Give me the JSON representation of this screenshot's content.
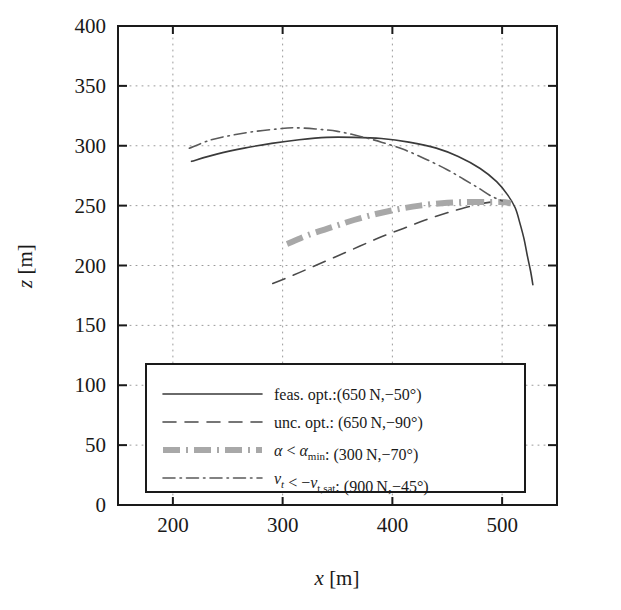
{
  "chart_data": {
    "type": "line",
    "title": "",
    "xlabel": "x [m]",
    "ylabel": "z [m]",
    "xlim": [
      150,
      550
    ],
    "ylim": [
      0,
      400
    ],
    "xticks": [
      200,
      300,
      400,
      500
    ],
    "yticks": [
      0,
      50,
      100,
      150,
      200,
      250,
      300,
      350,
      400
    ],
    "grid": true,
    "grid_style": "dotted",
    "legend_position": "lower-center",
    "series": [
      {
        "name": "feas. opt.:(650 N,−50°)",
        "label_plain": "feas. opt.:(650N,-50°)",
        "style": "solid",
        "color": "#3a3a3a",
        "width": 1.6,
        "points": [
          [
            217,
            287
          ],
          [
            240,
            293
          ],
          [
            265,
            298
          ],
          [
            290,
            302
          ],
          [
            315,
            305
          ],
          [
            340,
            307
          ],
          [
            365,
            307
          ],
          [
            390,
            306
          ],
          [
            415,
            303
          ],
          [
            440,
            298
          ],
          [
            460,
            291
          ],
          [
            480,
            281
          ],
          [
            495,
            270
          ],
          [
            505,
            259
          ],
          [
            512,
            248
          ],
          [
            516,
            236
          ],
          [
            520,
            222
          ],
          [
            523,
            208
          ],
          [
            526,
            195
          ],
          [
            528,
            184
          ]
        ]
      },
      {
        "name": "unc. opt.: (650 N,−90°)",
        "label_plain": "unc. opt.: (650N,-90°)",
        "style": "dashed",
        "color": "#4a4a4a",
        "width": 1.6,
        "points": [
          [
            291,
            185
          ],
          [
            310,
            192
          ],
          [
            330,
            200
          ],
          [
            350,
            208
          ],
          [
            370,
            216
          ],
          [
            390,
            224
          ],
          [
            410,
            231
          ],
          [
            430,
            238
          ],
          [
            450,
            244
          ],
          [
            465,
            248
          ],
          [
            478,
            251
          ],
          [
            490,
            253
          ],
          [
            500,
            254
          ]
        ]
      },
      {
        "name": "α < αmin: (300 N,−70°)",
        "label_plain": "α < α_min: (300N,-70°)",
        "style": "thick-dashdot",
        "color": "#a8a8a8",
        "width": 6.0,
        "points": [
          [
            304,
            218
          ],
          [
            325,
            226
          ],
          [
            345,
            232
          ],
          [
            365,
            238
          ],
          [
            385,
            243
          ],
          [
            405,
            247
          ],
          [
            425,
            250
          ],
          [
            445,
            252
          ],
          [
            465,
            253
          ],
          [
            485,
            253
          ],
          [
            500,
            253
          ],
          [
            508,
            252
          ]
        ]
      },
      {
        "name": "vt < −vt,sat: (900 N,−45°)",
        "label_plain": "v_t < -v_t,sat: (900N,-45°)",
        "style": "dashdot",
        "color": "#5a5a5a",
        "width": 1.6,
        "points": [
          [
            215,
            298
          ],
          [
            235,
            305
          ],
          [
            255,
            309
          ],
          [
            275,
            312
          ],
          [
            295,
            314
          ],
          [
            310,
            315
          ],
          [
            330,
            314
          ],
          [
            350,
            312
          ],
          [
            370,
            308
          ],
          [
            390,
            303
          ],
          [
            410,
            297
          ],
          [
            430,
            289
          ],
          [
            450,
            280
          ],
          [
            465,
            272
          ],
          [
            478,
            265
          ],
          [
            490,
            258
          ],
          [
            500,
            254
          ]
        ]
      }
    ]
  },
  "axes": {
    "x_tick_labels": [
      "200",
      "300",
      "400",
      "500"
    ],
    "y_tick_labels": [
      "0",
      "50",
      "100",
      "150",
      "200",
      "250",
      "300",
      "350",
      "400"
    ],
    "x_title_var": "x",
    "x_title_unit": "[m]",
    "y_title_var": "z",
    "y_title_unit": "[m]"
  },
  "legend": {
    "entries": [
      {
        "sample": "solid",
        "text_pre": "feas. opt.:(650",
        "text_unit": "N",
        "text_post": ",−50°)"
      },
      {
        "sample": "dashed",
        "text_pre": "unc. opt.: (650",
        "text_unit": "N",
        "text_post": ",−90°)"
      },
      {
        "sample": "thick-dashdot",
        "sym_a": "α",
        "sym_rel": " < ",
        "sym_b": "α",
        "sym_b_sub": "min",
        "text_pre": ": (300",
        "text_unit": "N",
        "text_post": ",−70°)"
      },
      {
        "sample": "dashdot",
        "sym_a": "v",
        "sym_a_sub": "t",
        "sym_rel": " < −",
        "sym_b": "v",
        "sym_b_sub": "t,sat",
        "text_pre": ": (900",
        "text_unit": "N",
        "text_post": ",−45°)"
      }
    ]
  },
  "colors": {
    "axis": "#1a1a1a",
    "grid": "#9a9a9a",
    "background": "#ffffff",
    "series_gray_thick": "#a8a8a8"
  }
}
